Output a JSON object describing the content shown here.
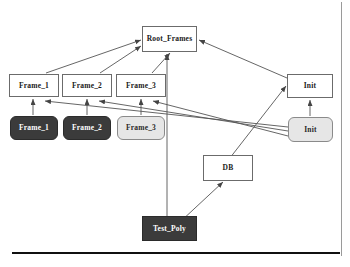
{
  "diagram": {
    "background_color": "#ffffff",
    "line_color": "#555555",
    "nodes": [
      {
        "id": "root-frames",
        "label": "Root_Frames",
        "style": "white",
        "shape": "rect",
        "x": 142,
        "y": 26,
        "w": 55,
        "h": 26,
        "font_size": 7.5
      },
      {
        "id": "frame-1-spec",
        "label": "Frame_1",
        "style": "white",
        "shape": "rect",
        "x": 9,
        "y": 74,
        "w": 50,
        "h": 23,
        "font_size": 7.5
      },
      {
        "id": "frame-2-spec",
        "label": "Frame_2",
        "style": "white",
        "shape": "rect",
        "x": 62,
        "y": 74,
        "w": 50,
        "h": 23,
        "font_size": 7.5
      },
      {
        "id": "frame-3-spec",
        "label": "Frame_3",
        "style": "white",
        "shape": "rect",
        "x": 116,
        "y": 74,
        "w": 50,
        "h": 23,
        "font_size": 7.5
      },
      {
        "id": "init-spec",
        "label": "Init",
        "style": "white",
        "shape": "rect",
        "x": 287,
        "y": 74,
        "w": 46,
        "h": 24,
        "font_size": 7.5
      },
      {
        "id": "frame-1-body",
        "label": "Frame_1",
        "style": "dark",
        "shape": "round",
        "x": 10,
        "y": 116,
        "w": 48,
        "h": 24,
        "font_size": 7.5
      },
      {
        "id": "frame-2-body",
        "label": "Frame_2",
        "style": "dark",
        "shape": "round",
        "x": 63,
        "y": 116,
        "w": 48,
        "h": 24,
        "font_size": 7.5
      },
      {
        "id": "frame-3-body",
        "label": "Frame_3",
        "style": "gray",
        "shape": "round",
        "x": 117,
        "y": 116,
        "w": 48,
        "h": 24,
        "font_size": 7.5
      },
      {
        "id": "init-body",
        "label": "Init",
        "style": "gray",
        "shape": "round",
        "x": 288,
        "y": 117,
        "w": 45,
        "h": 25,
        "font_size": 7.5
      },
      {
        "id": "db",
        "label": "DB",
        "style": "white",
        "shape": "rect",
        "x": 203,
        "y": 155,
        "w": 50,
        "h": 26,
        "font_size": 7.5
      },
      {
        "id": "test-poly",
        "label": "Test_Poly",
        "style": "dark",
        "shape": "rect",
        "x": 142,
        "y": 216,
        "w": 55,
        "h": 25,
        "font_size": 7.5
      }
    ],
    "edges": [
      {
        "id": "frame1-to-root",
        "from": "frame-1-spec",
        "to": "root-frames",
        "path": "M 46 73 L 141 40",
        "arrow_at": "141,40",
        "arrow_angle": -19
      },
      {
        "id": "frame2-to-root",
        "from": "frame-2-spec",
        "to": "root-frames",
        "path": "M 100 73 L 141 46",
        "arrow_at": "141,46",
        "arrow_angle": -33
      },
      {
        "id": "frame3-to-root",
        "from": "frame-3-spec",
        "to": "root-frames",
        "path": "M 152 73 L 170 53",
        "arrow_at": "170,53",
        "arrow_angle": -48
      },
      {
        "id": "init-to-root",
        "from": "init-spec",
        "to": "root-frames",
        "path": "M 287 78 L 199 40",
        "arrow_at": "199,40",
        "arrow_angle": 157
      },
      {
        "id": "testpoly-to-root",
        "from": "test-poly",
        "to": "root-frames",
        "path": "M 167 216 L 167 54",
        "arrow_at": "167,54",
        "arrow_angle": -90
      },
      {
        "id": "frame1body-to-frame1",
        "from": "frame-1-body",
        "to": "frame-1-spec",
        "path": "M 33 115 L 33 99",
        "arrow_at": "33,99",
        "arrow_angle": -90
      },
      {
        "id": "frame2body-to-frame2",
        "from": "frame-2-body",
        "to": "frame-2-spec",
        "path": "M 87 115 L 87 99",
        "arrow_at": "87,99",
        "arrow_angle": -90
      },
      {
        "id": "frame3body-to-frame3",
        "from": "frame-3-body",
        "to": "frame-3-spec",
        "path": "M 141 115 L 141 99",
        "arrow_at": "141,99",
        "arrow_angle": -90
      },
      {
        "id": "initbody-to-init",
        "from": "init-body",
        "to": "init-spec",
        "path": "M 310 116 L 310 100",
        "arrow_at": "310,100",
        "arrow_angle": -90
      },
      {
        "id": "initbody-to-frame1",
        "from": "init-body",
        "to": "frame-1-spec",
        "path": "M 288 127 L 45 101",
        "arrow_at": "45,101",
        "arrow_angle": 186
      },
      {
        "id": "initbody-to-frame2",
        "from": "init-body",
        "to": "frame-2-spec",
        "path": "M 288 131 L 99 101",
        "arrow_at": "99,101",
        "arrow_angle": 189
      },
      {
        "id": "initbody-to-frame3",
        "from": "init-body",
        "to": "frame-3-spec",
        "path": "M 288 136 L 153 101",
        "arrow_at": "153,101",
        "arrow_angle": 194
      },
      {
        "id": "db-to-init",
        "from": "db",
        "to": "init-spec",
        "path": "M 212 181 L 286 86",
        "arrow_at": "286,86",
        "arrow_angle": -52
      },
      {
        "id": "testpoly-to-db",
        "from": "test-poly",
        "to": "db",
        "path": "M 180 222 L 223 182",
        "arrow_at": "223,182",
        "arrow_angle": -43
      }
    ],
    "rules": [
      {
        "id": "bottom-rule",
        "x": 12,
        "y": 252,
        "w": 328,
        "h": 2
      },
      {
        "id": "right-rule",
        "x": 341,
        "y": 2,
        "w": 1,
        "h": 254
      }
    ]
  }
}
